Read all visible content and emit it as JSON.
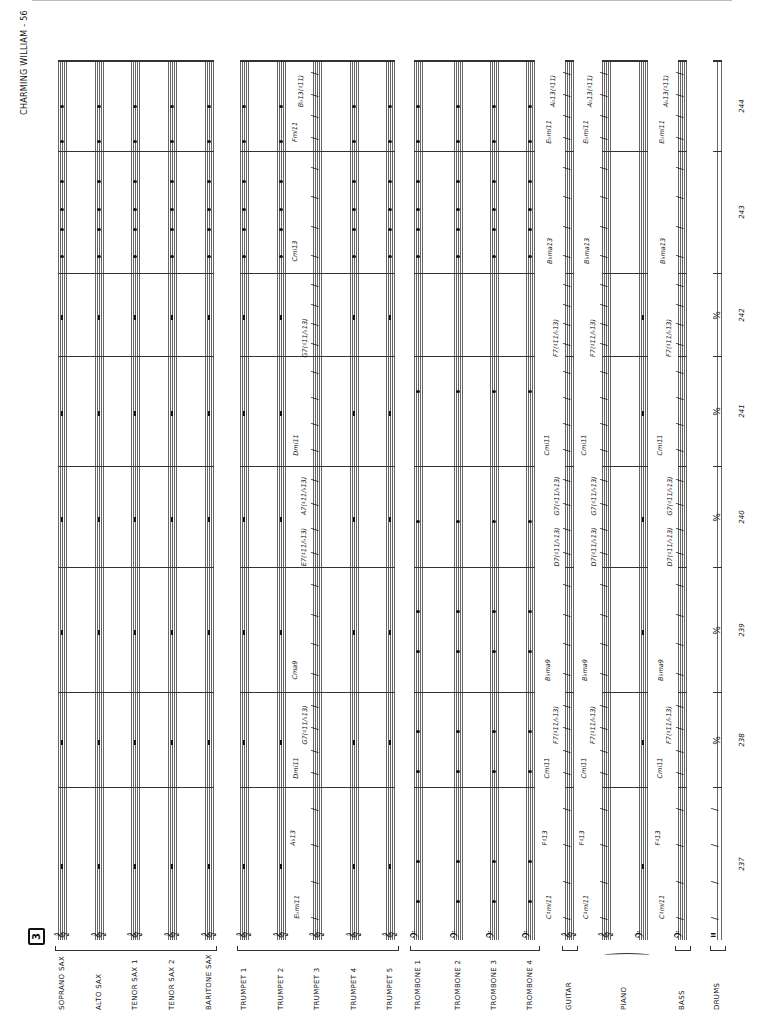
{
  "page": {
    "title": "CHARMING WILLIAM - 56",
    "rehearsal_mark": "3"
  },
  "instruments": [
    {
      "name": "SOPRANO SAX",
      "clef": "treble",
      "x": 58
    },
    {
      "name": "ALTO SAX",
      "clef": "treble",
      "x": 95
    },
    {
      "name": "TENOR SAX 1",
      "clef": "treble",
      "x": 131
    },
    {
      "name": "TENOR SAX 2",
      "clef": "treble",
      "x": 168
    },
    {
      "name": "BARITONE SAX",
      "clef": "treble",
      "x": 205
    },
    {
      "name": "TRUMPET 1",
      "clef": "treble",
      "x": 240
    },
    {
      "name": "TRUMPET 2",
      "clef": "treble",
      "x": 277
    },
    {
      "name": "TRUMPET 3",
      "clef": "treble",
      "x": 313
    },
    {
      "name": "TRUMPET 4",
      "clef": "treble",
      "x": 350
    },
    {
      "name": "TRUMPET 5",
      "clef": "treble",
      "x": 386
    },
    {
      "name": "TROMBONE 1",
      "clef": "bass",
      "x": 414
    },
    {
      "name": "TROMBONE 2",
      "clef": "bass",
      "x": 454
    },
    {
      "name": "TROMBONE 3",
      "clef": "bass",
      "x": 490
    },
    {
      "name": "TROMBONE 4",
      "clef": "bass",
      "x": 526
    },
    {
      "name": "GUITAR",
      "clef": "treble",
      "x": 565
    },
    {
      "name": "PIANO",
      "clef": "treble",
      "x": 602
    },
    {
      "name": "PIANO-LH",
      "clef": "bass",
      "x": 639
    },
    {
      "name": "BASS",
      "clef": "bass",
      "x": 678
    },
    {
      "name": "DRUMS",
      "clef": "percussion",
      "x": 713
    }
  ],
  "labels": {
    "soprano_sax": "SOPRANO SAX",
    "alto_sax": "ALTO SAX",
    "tenor_sax_1": "TENOR SAX 1",
    "tenor_sax_2": "TENOR SAX 2",
    "baritone_sax": "BARITONE SAX",
    "trumpet_1": "TRUMPET 1",
    "trumpet_2": "TRUMPET 2",
    "trumpet_3": "TRUMPET 3",
    "trumpet_4": "TRUMPET 4",
    "trumpet_5": "TRUMPET 5",
    "trombone_1": "TROMBONE 1",
    "trombone_2": "TROMBONE 2",
    "trombone_3": "TROMBONE 3",
    "trombone_4": "TROMBONE 4",
    "guitar": "GUITAR",
    "piano": "PIANO",
    "bass": "BASS",
    "drums": "DRUMS"
  },
  "measures": [
    {
      "number": "237",
      "y_top": 787,
      "y_bottom": 940
    },
    {
      "number": "238",
      "y_top": 692,
      "y_bottom": 787
    },
    {
      "number": "239",
      "y_top": 567,
      "y_bottom": 692
    },
    {
      "number": "240",
      "y_top": 466,
      "y_bottom": 567
    },
    {
      "number": "241",
      "y_top": 356,
      "y_bottom": 466
    },
    {
      "number": "242",
      "y_top": 273,
      "y_bottom": 356
    },
    {
      "number": "243",
      "y_top": 151,
      "y_bottom": 273
    },
    {
      "number": "244",
      "y_top": 60,
      "y_bottom": 151
    }
  ],
  "chords": {
    "trumpet_3": [
      "E♭mi11",
      "A♭13",
      "Dmi11",
      "G7(♯11/♭13)",
      "Cma9",
      "E7(♯11/♭13)",
      "A7(♯11/♭13)",
      "Dmi11",
      "G7(♯11/♭13)",
      "Cmi13",
      "Fmi11",
      "B♭13(♯11)"
    ],
    "guitar": [
      "C♯mi11",
      "F♯13",
      "Cmi11",
      "F7(♯11/♭13)",
      "B♭ma9",
      "D7(♯11/♭13)",
      "G7(♯11/♭13)",
      "Cmi11",
      "F7(♯11/♭13)",
      "B♭ma13",
      "E♭mi11",
      "A♭13(♯11)"
    ],
    "piano": [
      "C♯mi11",
      "F♯13",
      "Cmi11",
      "F7(♯11/♭13)",
      "B♭ma9",
      "D7(♯11/♭13)",
      "G7(♯11/♭13)",
      "Cmi11",
      "F7(♯11/♭13)",
      "B♭ma13",
      "E♭mi11",
      "A♭13(♯11)"
    ],
    "bass": [
      "C♯mi11",
      "F♯13",
      "Cmi11",
      "F7(♯11/♭13)",
      "B♭ma9",
      "D7(♯11/♭13)",
      "G7(♯11/♭13)",
      "Cmi11",
      "F7(♯11/♭13)",
      "B♭ma13",
      "E♭mi11",
      "A♭13(♯11)"
    ]
  },
  "symbols": {
    "slash": "/",
    "repeat": "%",
    "treble_clef": "𝄞",
    "bass_clef": "𝄢",
    "percussion_clef": "𝄥"
  }
}
